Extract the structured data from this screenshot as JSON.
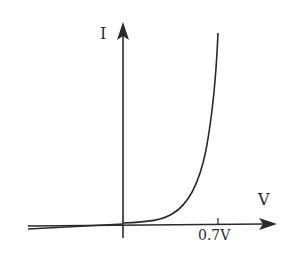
{
  "diagram": {
    "y_axis_label": "I",
    "x_axis_label": "V",
    "tick_label": "0.7V",
    "colors": {
      "stroke": "#2a2a2a",
      "background": "#ffffff"
    }
  }
}
